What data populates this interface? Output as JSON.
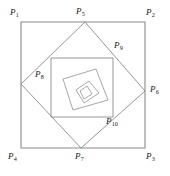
{
  "figure": {
    "canvas": {
      "width": 170,
      "height": 176
    },
    "stroke_color": "#8a8a8a",
    "label_color": "#1a1a1a",
    "background": "#ffffff"
  },
  "labels": [
    {
      "id": "P1",
      "base": "P",
      "sub": "1",
      "text": "P1",
      "x": 10,
      "y": 8,
      "point": [
        21,
        22
      ]
    },
    {
      "id": "P2",
      "base": "P",
      "sub": "2",
      "text": "P2",
      "x": 146,
      "y": 8,
      "point": [
        145,
        22
      ]
    },
    {
      "id": "P3",
      "base": "P",
      "sub": "3",
      "text": "P3",
      "x": 146,
      "y": 152,
      "point": [
        145,
        148
      ]
    },
    {
      "id": "P4",
      "base": "P",
      "sub": "4",
      "text": "P4",
      "x": 8,
      "y": 152,
      "point": [
        21,
        148
      ]
    },
    {
      "id": "P5",
      "base": "P",
      "sub": "5",
      "text": "P5",
      "x": 76,
      "y": 7,
      "point": [
        85,
        22
      ]
    },
    {
      "id": "P6",
      "base": "P",
      "sub": "6",
      "text": "P6",
      "x": 150,
      "y": 85,
      "point": [
        145,
        91
      ]
    },
    {
      "id": "P7",
      "base": "P",
      "sub": "7",
      "text": "P7",
      "x": 75,
      "y": 152,
      "point": [
        81,
        148
      ]
    },
    {
      "id": "P8",
      "base": "P",
      "sub": "8",
      "text": "P8",
      "x": 35,
      "y": 70,
      "point": [
        21,
        84
      ]
    },
    {
      "id": "P9",
      "base": "P",
      "sub": "9",
      "text": "P9",
      "x": 114,
      "y": 41,
      "point": [
        113,
        58
      ]
    },
    {
      "id": "P10",
      "base": "P",
      "sub": "10",
      "text": "P10",
      "x": 106,
      "y": 117,
      "point": [
        113,
        117
      ]
    }
  ],
  "polygons": [
    {
      "name": "outer-square",
      "level": 1,
      "points": "21,22 145,22 145,148 21,148",
      "vertices": [
        "P1",
        "P2",
        "P3",
        "P4"
      ]
    },
    {
      "name": "square-2",
      "level": 2,
      "points": "85,22 145,91 81,148 21,84",
      "vertices": [
        "P5",
        "P6",
        "P7",
        "P8"
      ]
    },
    {
      "name": "square-3",
      "level": 3,
      "points": "113,58 113,117 51,117 51,58",
      "vertices": [
        "P9",
        "P10"
      ]
    },
    {
      "name": "square-4",
      "level": 4,
      "points": "96,69 108,100 73,110 63,79",
      "vertices": []
    },
    {
      "name": "square-5",
      "level": 5,
      "points": "89,81 99,93 84,103 76,90",
      "vertices": []
    },
    {
      "name": "square-6",
      "level": 6,
      "points": "87,86 92,94 84,99 80,91",
      "vertices": []
    }
  ]
}
